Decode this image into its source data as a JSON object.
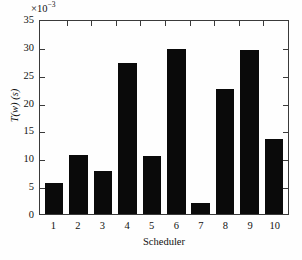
{
  "chart_data": {
    "type": "bar",
    "title": "",
    "xlabel": "Scheduler",
    "ylabel": "T(w) (s)",
    "y_multiplier_text": "×10",
    "y_multiplier_exponent": "−3",
    "categories": [
      "1",
      "2",
      "3",
      "4",
      "5",
      "6",
      "7",
      "8",
      "9",
      "10"
    ],
    "values": [
      5.5,
      10.6,
      7.8,
      27.1,
      10.4,
      29.7,
      2.0,
      22.4,
      29.5,
      13.4
    ],
    "ylim": [
      0,
      35
    ],
    "yticks": [
      0,
      5,
      10,
      15,
      20,
      25,
      30,
      35
    ],
    "ytick_labels": [
      "0",
      "5",
      "10",
      "15",
      "20",
      "25",
      "30",
      "35"
    ],
    "grid": false,
    "legend": null,
    "bar_color": "#0a0a0a",
    "axis_color": "#3a3a3a",
    "background_color": "#fefefe"
  }
}
